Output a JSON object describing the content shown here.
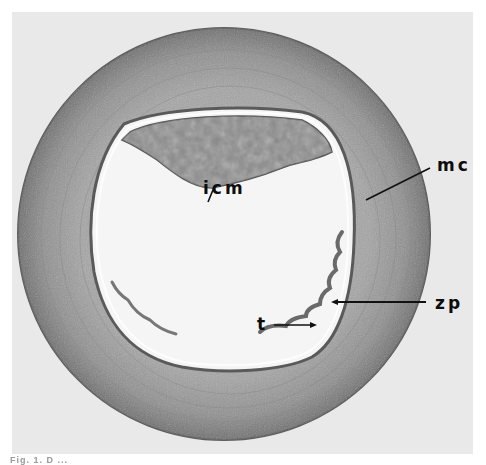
{
  "figure": {
    "labels": {
      "icm": "icm",
      "mc": "mc",
      "zp": "zp",
      "t": "t"
    },
    "caption": "Fig. 1. D ... ",
    "colors": {
      "background": "#e9e9e9",
      "mucin_coat": "#9a9a9a",
      "mucin_coat_edge": "#6a6a6a",
      "cavity": "#f4f4f4",
      "icm_mass": "#8c8c8c",
      "label": "#0d0d0d"
    }
  }
}
